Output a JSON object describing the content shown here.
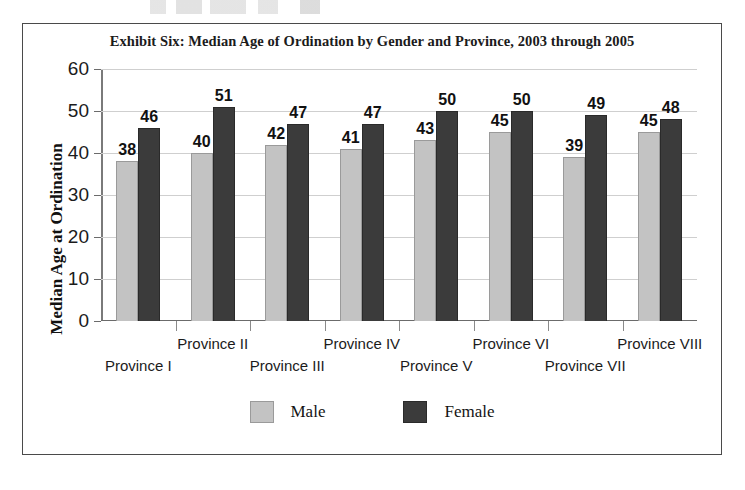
{
  "chart_data": {
    "type": "bar",
    "title": "Exhibit Six: Median Age of Ordination by Gender and Province, 2003 through 2005",
    "xlabel": "",
    "ylabel": "Median Age at Ordination",
    "ylim": [
      0,
      60
    ],
    "yticks": [
      0,
      10,
      20,
      30,
      40,
      50,
      60
    ],
    "grid": true,
    "legend_position": "bottom",
    "categories": [
      "Province I",
      "Province II",
      "Province III",
      "Province IV",
      "Province V",
      "Province VI",
      "Province VII",
      "Province VIII"
    ],
    "series": [
      {
        "name": "Male",
        "color": "#c3c3c3",
        "values": [
          38,
          40,
          42,
          41,
          43,
          45,
          39,
          45
        ]
      },
      {
        "name": "Female",
        "color": "#3b3b3b",
        "values": [
          46,
          51,
          47,
          47,
          50,
          50,
          49,
          48
        ]
      }
    ]
  },
  "legend": {
    "items": [
      {
        "label": "Male"
      },
      {
        "label": "Female"
      }
    ]
  }
}
